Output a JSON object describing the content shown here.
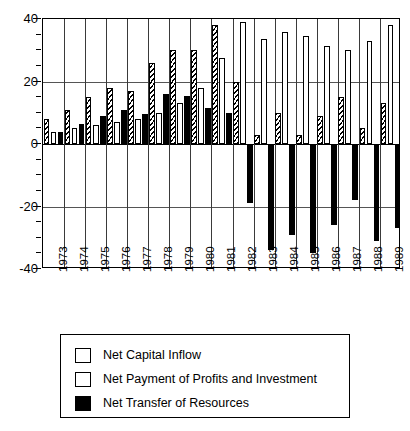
{
  "chart_data": {
    "type": "bar",
    "title": "",
    "subtitle": "",
    "xlabel": "",
    "ylabel": "",
    "ylim": [
      -40,
      40
    ],
    "yticks": [
      -40,
      -20,
      0,
      20,
      40
    ],
    "ytick_labels": [
      "-40",
      "-20",
      "0",
      "20",
      "40"
    ],
    "grid": "horizontal-at-major-y-and-vertical-year-separators",
    "legend_position": "below-plot-boxed",
    "categories": [
      "1973",
      "1974",
      "1975",
      "1976",
      "1977",
      "1978",
      "1979",
      "1980",
      "1981",
      "1982",
      "1983",
      "1984",
      "1985",
      "1986",
      "1987",
      "1988",
      "1989"
    ],
    "series": [
      {
        "name": "Net Capital Inflow",
        "style": "hatched",
        "color": "#000000",
        "values": [
          8,
          11,
          15,
          18,
          17,
          26,
          30,
          30,
          38,
          20,
          3,
          10,
          3,
          9,
          15,
          5,
          13
        ]
      },
      {
        "name": "Net Payment of Profits and Investment",
        "style": "white",
        "color": "#ffffff",
        "values": [
          4,
          5,
          6,
          7,
          8,
          10,
          13,
          18,
          27.5,
          39,
          33.5,
          36,
          34.5,
          31.5,
          30,
          33,
          38
        ]
      },
      {
        "name": "Net Transfer of Resources",
        "style": "solid-black",
        "color": "#000000",
        "values": [
          4,
          6.5,
          9,
          11,
          9.5,
          16,
          15.5,
          11.5,
          10,
          -19,
          -34,
          -29,
          -35,
          -26,
          -18,
          -31,
          -27
        ]
      }
    ]
  },
  "legend": {
    "items": [
      {
        "label": "Net Capital Inflow",
        "swatch": "hatched"
      },
      {
        "label": "Net Payment of Profits and Investment",
        "swatch": "white"
      },
      {
        "label": "Net Transfer of Resources",
        "swatch": "black"
      }
    ]
  }
}
